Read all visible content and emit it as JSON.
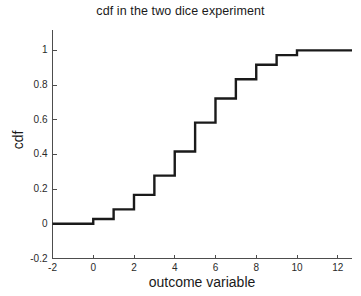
{
  "chart_data": {
    "type": "line",
    "title": "cdf in the two dice experiment",
    "xlabel": "outcome variable",
    "ylabel": "cdf",
    "xlim": [
      -2,
      12.7
    ],
    "ylim": [
      -0.2,
      1.1
    ],
    "xticks": [
      -2,
      0,
      2,
      4,
      6,
      8,
      10,
      12
    ],
    "xticklabels": [
      "-2",
      "0",
      "2",
      "4",
      "6",
      "8",
      "10",
      "12"
    ],
    "yticks": [
      -0.2,
      0,
      0.2,
      0.4,
      0.6,
      0.8,
      1
    ],
    "yticklabels": [
      "-0.2",
      "0",
      "0.2",
      "0.4",
      "0.6",
      "0.8",
      "1"
    ],
    "grid": false,
    "legend": false,
    "style": "step-post",
    "line_color": "#1a1a1a",
    "axis_color": "#4d4d4d",
    "x": [
      -2,
      0,
      1,
      2,
      3,
      4,
      5,
      6,
      7,
      8,
      9,
      10,
      12.7
    ],
    "y": [
      0,
      0.0278,
      0.0833,
      0.1667,
      0.2778,
      0.4167,
      0.5833,
      0.7222,
      0.8333,
      0.9167,
      0.9722,
      1,
      1
    ],
    "jump_points": [
      {
        "x": 0,
        "cdf": 0.0278,
        "pmf": "1/36"
      },
      {
        "x": 1,
        "cdf": 0.0833,
        "pmf": "2/36"
      },
      {
        "x": 2,
        "cdf": 0.1667,
        "pmf": "3/36"
      },
      {
        "x": 3,
        "cdf": 0.2778,
        "pmf": "4/36"
      },
      {
        "x": 4,
        "cdf": 0.4167,
        "pmf": "5/36"
      },
      {
        "x": 5,
        "cdf": 0.5833,
        "pmf": "6/36"
      },
      {
        "x": 6,
        "cdf": 0.7222,
        "pmf": "5/36"
      },
      {
        "x": 7,
        "cdf": 0.8333,
        "pmf": "4/36"
      },
      {
        "x": 8,
        "cdf": 0.9167,
        "pmf": "3/36"
      },
      {
        "x": 9,
        "cdf": 0.9722,
        "pmf": "2/36"
      },
      {
        "x": 10,
        "cdf": 1.0,
        "pmf": "1/36"
      }
    ]
  },
  "axes": {
    "ytick_labels": [
      {
        "text": "1",
        "top": 50,
        "right": 48
      },
      {
        "text": "0.8",
        "top": 83,
        "right": 48
      },
      {
        "text": "0.6",
        "top": 116,
        "right": 48
      },
      {
        "text": "0.4",
        "top": 149,
        "right": 48
      },
      {
        "text": "0.2",
        "top": 182,
        "right": 48
      },
      {
        "text": "0",
        "top": 218,
        "right": 48
      },
      {
        "text": "-0.2",
        "top": 251,
        "right": 48
      }
    ],
    "xtick_labels": [
      {
        "text": "-2",
        "left": 52,
        "top": 261
      },
      {
        "text": "0",
        "left": 93,
        "top": 261
      },
      {
        "text": "2",
        "left": 134,
        "top": 261
      },
      {
        "text": "4",
        "left": 175,
        "top": 261
      },
      {
        "text": "6",
        "left": 216,
        "top": 261
      },
      {
        "text": "8",
        "left": 257,
        "top": 261
      },
      {
        "text": "10",
        "left": 298,
        "top": 261
      },
      {
        "text": "12",
        "left": 339,
        "top": 261
      }
    ]
  }
}
